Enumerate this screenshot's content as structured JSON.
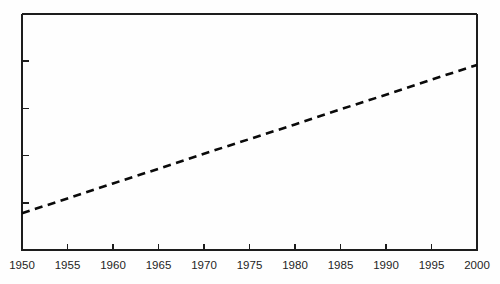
{
  "chart_data": {
    "type": "line",
    "title": "",
    "subtitle": "",
    "xlabel": "",
    "ylabel": "",
    "xlim": [
      1950,
      2000
    ],
    "ylim": [
      0,
      5
    ],
    "grid": false,
    "legend": null,
    "annotations": [],
    "x_tick_labels": [
      "1950",
      "1955",
      "1960",
      "1965",
      "1970",
      "1975",
      "1980",
      "1985",
      "1990",
      "1995",
      "2000"
    ],
    "x_ticks": [
      1950,
      1955,
      1960,
      1965,
      1970,
      1975,
      1980,
      1985,
      1990,
      1995,
      2000
    ],
    "y_ticks": [
      1,
      2,
      3,
      4
    ],
    "y_tick_labels": [
      "",
      "",
      "",
      ""
    ],
    "series": [
      {
        "name": "trend",
        "style": "dashed",
        "color": "#0a0a0a",
        "x": [
          1950,
          1955,
          1960,
          1965,
          1970,
          1975,
          1980,
          1985,
          1990,
          1995,
          2000
        ],
        "values": [
          0.78,
          1.09,
          1.41,
          1.72,
          2.04,
          2.35,
          2.66,
          2.98,
          3.29,
          3.61,
          3.92
        ]
      }
    ]
  },
  "plot_box": {
    "left": 22,
    "right": 477,
    "top": 14,
    "bottom": 250
  },
  "axes": {
    "x_axis_name": "x-axis",
    "y_axis_name": "y-axis"
  }
}
